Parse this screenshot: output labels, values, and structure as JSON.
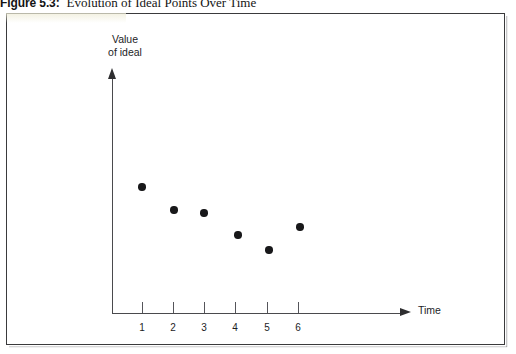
{
  "caption": {
    "label": "Figure 5.3:",
    "text": "Evolution of Ideal Points Over Time"
  },
  "colors": {
    "dot": "#18181a",
    "axis": "#4a4a4d",
    "frame_border": "#3a3a3c",
    "background": "#ffffff",
    "text": "#1d1d1f"
  },
  "chart_data": {
    "type": "scatter",
    "title": "Evolution of Ideal Points Over Time",
    "xlabel": "Time",
    "ylabel": "Value of ideal",
    "ylabel_lines": [
      "Value",
      "of ideal"
    ],
    "grid": false,
    "legend": null,
    "xlim": [
      0,
      7
    ],
    "ylim": [
      0,
      10
    ],
    "xticks": [
      "1",
      "2",
      "3",
      "4",
      "5",
      "6"
    ],
    "yticks": [],
    "x": [
      1,
      2,
      3,
      4,
      5,
      6
    ],
    "y": [
      8.1,
      6.7,
      6.4,
      5.0,
      4.0,
      5.7
    ],
    "points": [
      {
        "label": "1",
        "x": 1,
        "y": 8.1,
        "px": 142,
        "py": 187
      },
      {
        "label": "2",
        "x": 2,
        "y": 6.7,
        "px": 174,
        "py": 210
      },
      {
        "label": "3",
        "x": 3,
        "y": 6.4,
        "px": 204,
        "py": 213
      },
      {
        "label": "4",
        "x": 4,
        "y": 5.0,
        "px": 238,
        "py": 235
      },
      {
        "label": "5",
        "x": 5,
        "y": 4.0,
        "px": 269,
        "py": 250
      },
      {
        "label": "6",
        "x": 6,
        "y": 5.7,
        "px": 300,
        "py": 227
      }
    ],
    "tick_px": [
      142,
      173,
      204,
      235,
      267,
      298
    ]
  }
}
